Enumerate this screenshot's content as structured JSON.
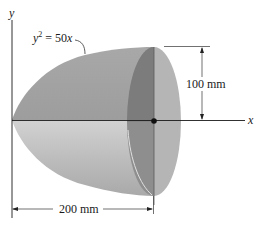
{
  "figure": {
    "axes": {
      "y_label": "y",
      "x_label": "x"
    },
    "curve_equation": {
      "base": "y",
      "exponent": "2",
      "rest": " = 50",
      "var": "x"
    },
    "dimensions": {
      "radius_label": "100 mm",
      "length_label": "200 mm"
    },
    "colors": {
      "body_upper": "#a6a6a6",
      "body_lower": "#c4c4c4",
      "face_dark": "#7d7d7d",
      "face_light": "#b8b8b8",
      "line": "#1a1a1a"
    }
  }
}
